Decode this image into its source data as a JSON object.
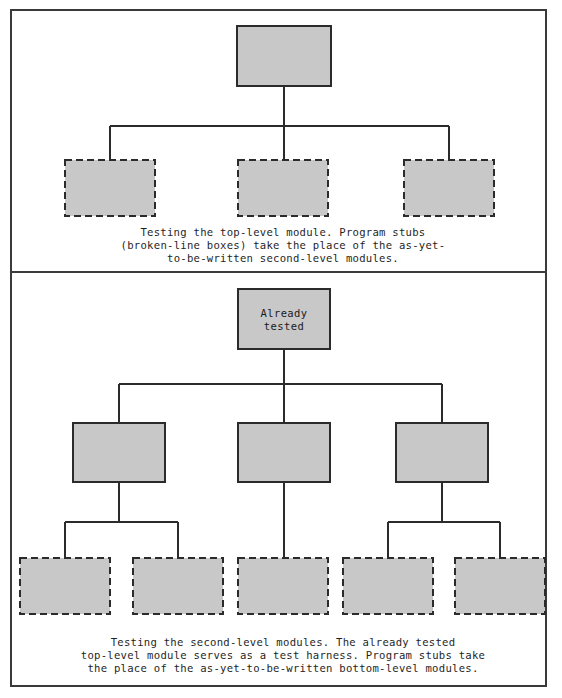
{
  "figure": {
    "canvas": {
      "width": 562,
      "height": 698
    },
    "style": {
      "page_background": "#ffffff",
      "frame_stroke": "#3a3a3a",
      "frame_stroke_width": 2,
      "divider_stroke": "#3a3a3a",
      "divider_stroke_width": 2,
      "module_fill": "#c8c8c8",
      "module_stroke_solid": "#2b2b2b",
      "module_stroke_dashed": "#2b2b2b",
      "module_stroke_width": 2,
      "dash_pattern": "7,4",
      "connector_stroke": "#2b2b2b",
      "connector_stroke_width": 1.3,
      "caption_color": "#1f1f1f",
      "label_color": "#1a1a1a"
    },
    "frame": {
      "x": 11,
      "y": 10,
      "width": 535,
      "height": 676
    },
    "divider": {
      "x1": 11,
      "y1": 272,
      "x2": 546,
      "y2": 272
    }
  },
  "panels": [
    {
      "id": "panel-top",
      "name": "testing-top-level-module",
      "caption": [
        "Testing the top-level module. Program stubs",
        "(broken-line boxes) take the place of the as-yet-",
        "to-be-written second-level modules."
      ],
      "caption_x": 283,
      "caption_start_y": 236,
      "caption_line_height": 13,
      "modules": [
        {
          "id": "t-root",
          "name": "top-level-module",
          "style": "solid",
          "label": "",
          "x": 237,
          "y": 26,
          "width": 94,
          "height": 60
        },
        {
          "id": "t-stub-1",
          "name": "program-stub-left",
          "style": "dashed",
          "label": "",
          "x": 65,
          "y": 160,
          "width": 90,
          "height": 56
        },
        {
          "id": "t-stub-2",
          "name": "program-stub-center",
          "style": "dashed",
          "label": "",
          "x": 238,
          "y": 160,
          "width": 90,
          "height": 56
        },
        {
          "id": "t-stub-3",
          "name": "program-stub-right",
          "style": "dashed",
          "label": "",
          "x": 404,
          "y": 160,
          "width": 90,
          "height": 56
        }
      ],
      "connectors": [
        {
          "name": "connector-root-drop",
          "points": "284,86 284,126"
        },
        {
          "name": "connector-bus",
          "points": "110,126 449,126"
        },
        {
          "name": "connector-stub-1",
          "points": "110,126 110,160"
        },
        {
          "name": "connector-stub-2",
          "points": "284,126 284,160"
        },
        {
          "name": "connector-stub-3",
          "points": "449,126 449,160"
        }
      ]
    },
    {
      "id": "panel-bottom",
      "name": "testing-second-level-modules",
      "caption": [
        "Testing the second-level modules. The already tested",
        "top-level module serves as a test harness. Program stubs take",
        "the place of the as-yet-to-be-written bottom-level modules."
      ],
      "caption_x": 283,
      "caption_start_y": 646,
      "caption_line_height": 13,
      "modules": [
        {
          "id": "b-root",
          "name": "already-tested-top-level-module",
          "style": "solid",
          "label": "Already\ntested",
          "x": 238,
          "y": 289,
          "width": 92,
          "height": 60
        },
        {
          "id": "b-mid-1",
          "name": "second-level-module-left",
          "style": "solid",
          "label": "",
          "x": 73,
          "y": 423,
          "width": 92,
          "height": 59
        },
        {
          "id": "b-mid-2",
          "name": "second-level-module-center",
          "style": "solid",
          "label": "",
          "x": 238,
          "y": 423,
          "width": 92,
          "height": 59
        },
        {
          "id": "b-mid-3",
          "name": "second-level-module-right",
          "style": "solid",
          "label": "",
          "x": 396,
          "y": 423,
          "width": 92,
          "height": 59
        },
        {
          "id": "b-stub-1",
          "name": "program-stub-1",
          "style": "dashed",
          "label": "",
          "x": 20,
          "y": 558,
          "width": 90,
          "height": 56
        },
        {
          "id": "b-stub-2",
          "name": "program-stub-2",
          "style": "dashed",
          "label": "",
          "x": 133,
          "y": 558,
          "width": 90,
          "height": 56
        },
        {
          "id": "b-stub-3",
          "name": "program-stub-3",
          "style": "dashed",
          "label": "",
          "x": 238,
          "y": 558,
          "width": 90,
          "height": 56
        },
        {
          "id": "b-stub-4",
          "name": "program-stub-4",
          "style": "dashed",
          "label": "",
          "x": 343,
          "y": 558,
          "width": 90,
          "height": 56
        },
        {
          "id": "b-stub-5",
          "name": "program-stub-5",
          "style": "dashed",
          "label": "",
          "x": 455,
          "y": 558,
          "width": 90,
          "height": 56
        }
      ],
      "connectors": [
        {
          "name": "connector-root-drop",
          "points": "284,349 284,384"
        },
        {
          "name": "connector-bus-level2",
          "points": "119,384 442,384"
        },
        {
          "name": "connector-mid-1",
          "points": "119,384 119,423"
        },
        {
          "name": "connector-mid-2",
          "points": "284,384 284,423"
        },
        {
          "name": "connector-mid-3",
          "points": "442,384 442,423"
        },
        {
          "name": "connector-mid-1-drop",
          "points": "119,482 119,522"
        },
        {
          "name": "connector-bus-left",
          "points": "65,522 178,522"
        },
        {
          "name": "connector-stub-1",
          "points": "65,522 65,558"
        },
        {
          "name": "connector-stub-2",
          "points": "178,522 178,558"
        },
        {
          "name": "connector-mid-2-drop",
          "points": "284,482 284,558"
        },
        {
          "name": "connector-mid-3-drop",
          "points": "442,482 442,522"
        },
        {
          "name": "connector-bus-right",
          "points": "388,522 500,522"
        },
        {
          "name": "connector-stub-4",
          "points": "388,522 388,558"
        },
        {
          "name": "connector-stub-5",
          "points": "500,522 500,558"
        }
      ]
    }
  ]
}
